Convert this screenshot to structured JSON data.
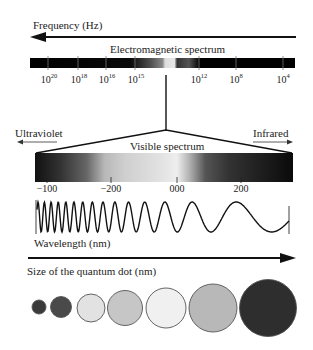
{
  "frequency": {
    "label": "Frequency (Hz)",
    "arrow_direction": "left"
  },
  "em_spectrum": {
    "title": "Electromagnetic spectrum",
    "ticks": [
      {
        "base": "10",
        "exp": "20",
        "x": 49
      },
      {
        "base": "10",
        "exp": "18",
        "x": 79
      },
      {
        "base": "10",
        "exp": "16",
        "x": 107
      },
      {
        "base": "10",
        "exp": "15",
        "x": 136
      },
      {
        "base": "10",
        "exp": "12",
        "x": 199
      },
      {
        "base": "10",
        "exp": "8",
        "x": 236
      },
      {
        "base": "10",
        "exp": "4",
        "x": 283
      }
    ]
  },
  "visible_spectrum": {
    "title": "Visible spectrum",
    "left_label": "Ultraviolet",
    "right_label": "Infrared",
    "ticks": [
      {
        "label": "-100",
        "x": 47
      },
      {
        "label": "-200",
        "x": 111
      },
      {
        "label": "000",
        "x": 177
      },
      {
        "label": "200",
        "x": 241
      }
    ]
  },
  "wavelength": {
    "label": "Wavelength (nm)"
  },
  "quantum_dot": {
    "label": "Size of the quantum dot (nm)",
    "arrow_direction": "right",
    "dots": [
      {
        "cx": 39,
        "cy": 307,
        "r": 7,
        "fill": "#3a3a3a"
      },
      {
        "cx": 61,
        "cy": 307,
        "r": 10.5,
        "fill": "#4a4a4a"
      },
      {
        "cx": 91,
        "cy": 308,
        "r": 14,
        "fill": "#e2e2e2"
      },
      {
        "cx": 125,
        "cy": 308,
        "r": 17.5,
        "fill": "#c6c6c6"
      },
      {
        "cx": 166,
        "cy": 308,
        "r": 20,
        "fill": "#f0f0f0"
      },
      {
        "cx": 213,
        "cy": 308,
        "r": 24,
        "fill": "#b8b8b8"
      },
      {
        "cx": 268,
        "cy": 308,
        "r": 28.5,
        "fill": "#2e2e2e"
      }
    ]
  }
}
